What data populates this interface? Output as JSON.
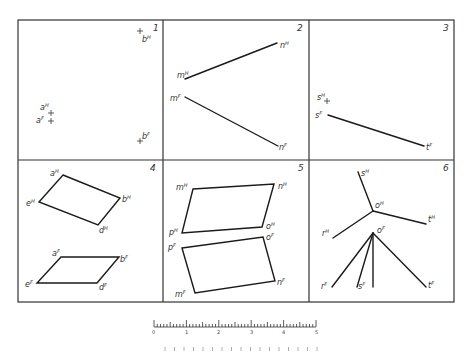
{
  "figure": {
    "panels": [
      {
        "number": "1",
        "labels": {
          "bH": "b",
          "bH_sup": "H",
          "aH": "a",
          "aH_sup": "H",
          "aF": "a",
          "aF_sup": "F",
          "bF": "b",
          "bF_sup": "F"
        }
      },
      {
        "number": "2",
        "labels": {
          "mH": "m",
          "mH_sup": "H",
          "nH": "n",
          "nH_sup": "H",
          "mF": "m",
          "mF_sup": "F",
          "nF": "n",
          "nF_sup": "F"
        }
      },
      {
        "number": "3",
        "labels": {
          "sH": "s",
          "sH_sup": "H",
          "sF": "s",
          "sF_sup": "F",
          "tF": "t",
          "tF_sup": "F"
        }
      },
      {
        "number": "4",
        "labels": {
          "aH": "a",
          "aH_sup": "H",
          "bH": "b",
          "bH_sup": "H",
          "eH": "e",
          "eH_sup": "H",
          "dH": "d",
          "dH_sup": "H",
          "aF": "a",
          "aF_sup": "F",
          "bF": "b",
          "bF_sup": "F",
          "eF": "e",
          "eF_sup": "F",
          "dF": "d",
          "dF_sup": "F"
        }
      },
      {
        "number": "5",
        "labels": {
          "mH": "m",
          "mH_sup": "H",
          "nH": "n",
          "nH_sup": "H",
          "pH": "p",
          "pH_sup": "H",
          "oH": "o",
          "oH_sup": "H",
          "pF": "p",
          "pF_sup": "F",
          "oF": "o",
          "oF_sup": "F",
          "mF": "m",
          "mF_sup": "F",
          "nF": "n",
          "nF_sup": "F"
        }
      },
      {
        "number": "6",
        "labels": {
          "sH": "s",
          "sH_sup": "H",
          "oH": "o",
          "oH_sup": "H",
          "tH": "t",
          "tH_sup": "H",
          "rH": "r",
          "rH_sup": "H",
          "oF": "o",
          "oF_sup": "F",
          "rF": "r",
          "rF_sup": "F",
          "sF": "s",
          "sF_sup": "F",
          "tF": "t",
          "tF_sup": "F"
        }
      }
    ],
    "scale": {
      "ticks": [
        "0",
        "1",
        "2",
        "3",
        "4",
        "5"
      ]
    }
  }
}
